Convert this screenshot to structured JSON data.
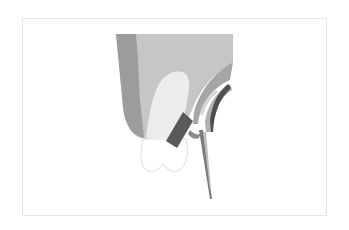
{
  "figure": {
    "title": "",
    "colors": {
      "background": "#ffffff",
      "frame_border": "#e6e6e6",
      "outer_tissue_dark": "#9c9c9c",
      "tissue_block": "#c6c6c6",
      "tooth_root": "#ececec",
      "crown_fill": "#ffffff",
      "crown_outline": "#e4e4e4",
      "bracket": "#595959",
      "bracket_base": "#8a8a8a",
      "arc_outer": "#a6a6a6",
      "arc_edge_dark": "#4e4e4e",
      "arc_inner_light": "#d4d4d4",
      "instrument": "#7a7a7a"
    },
    "elements": [
      {
        "name": "frame"
      },
      {
        "name": "tissue-block"
      },
      {
        "name": "tooth-root"
      },
      {
        "name": "tooth-crown"
      },
      {
        "name": "bracket"
      },
      {
        "name": "curved-instrument"
      },
      {
        "name": "needle"
      }
    ]
  }
}
